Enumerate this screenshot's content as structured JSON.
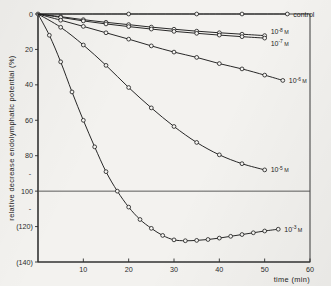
{
  "figure": {
    "background_color": "#f3f2ef",
    "ink_color": "#1c1c1c"
  },
  "chart_data": {
    "type": "line",
    "title": "",
    "xlabel": "time (min)",
    "ylabel": "relative decrease endolymphatic potential (%)",
    "xlim": [
      0,
      60
    ],
    "ylim": [
      140,
      0
    ],
    "y_axis_inverted": true,
    "grid": false,
    "legend_position": "right-of-curve-ends",
    "xticks": [
      10,
      20,
      30,
      40,
      50,
      60
    ],
    "xtick_labels": [
      "10",
      "20",
      "30",
      "40",
      "50",
      "60"
    ],
    "yticks": [
      0,
      20,
      40,
      60,
      80,
      100,
      120,
      140
    ],
    "ytick_labels": [
      "0",
      "20",
      "40",
      "60",
      "80",
      "100",
      "(120)",
      "(140)"
    ],
    "minor_yticks": [
      90,
      110
    ],
    "reference_lines": [
      {
        "axis": "y",
        "value": 100,
        "label": ""
      }
    ],
    "series": [
      {
        "name": "control",
        "label": "control",
        "label_base": "control",
        "label_exponent": "",
        "label_unit": "",
        "marker": "circle",
        "x": [
          0,
          20,
          35,
          45,
          55
        ],
        "y": [
          0,
          0,
          0,
          0,
          0
        ]
      },
      {
        "name": "1e-8 M",
        "label": "10⁻⁸ M",
        "label_base": "10",
        "label_exponent": "-8",
        "label_unit": "M",
        "marker": "circle",
        "x": [
          0,
          5,
          10,
          15,
          20,
          25,
          30,
          35,
          40,
          45,
          50
        ],
        "y": [
          0,
          1.5,
          3.2,
          4.7,
          6.0,
          7.4,
          8.6,
          9.7,
          10.6,
          11.4,
          12.2
        ]
      },
      {
        "name": "1e-7 M",
        "label": "10⁻⁷ M",
        "label_base": "10",
        "label_exponent": "-7",
        "label_unit": "M",
        "marker": "circle",
        "x": [
          0,
          5,
          10,
          15,
          20,
          25,
          30,
          35,
          40,
          45,
          50
        ],
        "y": [
          0,
          1.9,
          3.9,
          5.6,
          7.1,
          8.5,
          9.8,
          10.9,
          11.9,
          12.8,
          13.6
        ]
      },
      {
        "name": "1e-6 M",
        "label": "10⁻⁶ M",
        "label_base": "10",
        "label_exponent": "-6",
        "label_unit": "M",
        "marker": "circle",
        "x": [
          0,
          5,
          10,
          15,
          20,
          25,
          30,
          35,
          40,
          45,
          50,
          54
        ],
        "y": [
          0,
          3.5,
          7.0,
          10.6,
          14.2,
          18.0,
          21.5,
          24.5,
          28.0,
          31.0,
          34.5,
          37.5
        ]
      },
      {
        "name": "1e-5 M",
        "label": "10⁻⁵ M",
        "label_base": "10",
        "label_exponent": "-5",
        "label_unit": "M",
        "marker": "circle",
        "x": [
          0,
          5,
          10,
          15,
          20,
          25,
          30,
          35,
          40,
          45,
          50
        ],
        "y": [
          0,
          7.5,
          17.5,
          29.0,
          41.5,
          53.0,
          63.5,
          72.5,
          79.5,
          84.5,
          88.0
        ]
      },
      {
        "name": "1e-3 M",
        "label": "10⁻³ M",
        "label_base": "10",
        "label_exponent": "-3",
        "label_unit": "M",
        "marker": "circle",
        "x": [
          0,
          2.5,
          5,
          7.5,
          10,
          12.5,
          15,
          17.5,
          20,
          22.5,
          25,
          27.5,
          30,
          32.5,
          35,
          37.5,
          40,
          42.5,
          45,
          47.5,
          50,
          53
        ],
        "y": [
          0,
          12,
          27,
          44,
          60,
          75,
          89,
          100,
          109,
          116,
          121,
          125,
          127.5,
          128,
          127.8,
          127.3,
          126.5,
          125.5,
          124.5,
          123.5,
          122.5,
          121.5
        ]
      }
    ]
  }
}
